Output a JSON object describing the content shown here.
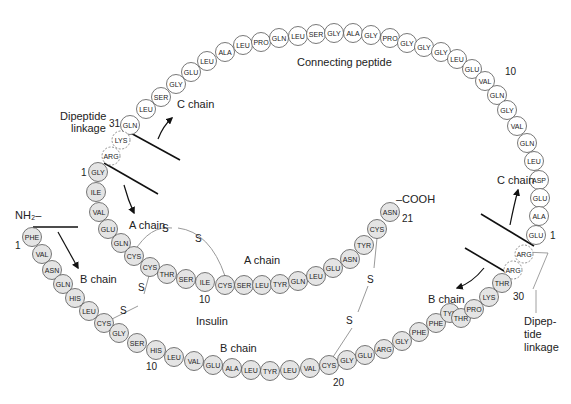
{
  "colors": {
    "filled_residue": "#e4e4e4",
    "open_residue": "#ffffff",
    "stroke": "#555555",
    "text": "#222222"
  },
  "labels": {
    "connecting_peptide": "Connecting peptide",
    "dipeptide_linkage_left_1": "Dipeptide",
    "dipeptide_linkage_left_2": "linkage",
    "dipeptide_linkage_right_1": "Dipep-",
    "dipeptide_linkage_right_2": "tide",
    "dipeptide_linkage_right_3": "linkage",
    "c_chain_top": "C chain",
    "c_chain_right": "C chain",
    "a_chain_arrow": "A chain",
    "a_chain_middle": "A chain",
    "b_chain_arrow_left": "B chain",
    "b_chain_arrow_right": "B chain",
    "b_chain_bottom": "B chain",
    "insulin": "Insulin",
    "nh2": "NH₂–",
    "cooh": "–COOH",
    "num_31": "31",
    "num_1_a": "1",
    "num_1_b": "1",
    "num_1_c": "1",
    "num_10_c": "10",
    "num_10_a": "10",
    "num_10_b": "10",
    "num_20_b": "20",
    "num_21_a": "21",
    "num_30_b": "30",
    "s1": "S",
    "s2": "S",
    "s3": "S",
    "s4": "S",
    "s5": "S",
    "s6": "S"
  },
  "c_peptide": [
    {
      "aa": "GLN",
      "x": 130,
      "y": 125
    },
    {
      "aa": "LEU",
      "x": 146,
      "y": 109
    },
    {
      "aa": "SER",
      "x": 161,
      "y": 97
    },
    {
      "aa": "GLY",
      "x": 176,
      "y": 84
    },
    {
      "aa": "GLU",
      "x": 191,
      "y": 72
    },
    {
      "aa": "LEU",
      "x": 207,
      "y": 61
    },
    {
      "aa": "ALA",
      "x": 225,
      "y": 52
    },
    {
      "aa": "LEU",
      "x": 243,
      "y": 45
    },
    {
      "aa": "PRO",
      "x": 261,
      "y": 42
    },
    {
      "aa": "GLN",
      "x": 279,
      "y": 38
    },
    {
      "aa": "LEU",
      "x": 298,
      "y": 36
    },
    {
      "aa": "SER",
      "x": 316,
      "y": 34
    },
    {
      "aa": "GLY",
      "x": 334,
      "y": 33
    },
    {
      "aa": "ALA",
      "x": 353,
      "y": 33
    },
    {
      "aa": "GLY",
      "x": 371,
      "y": 35
    },
    {
      "aa": "PRO",
      "x": 390,
      "y": 38
    },
    {
      "aa": "GLY",
      "x": 407,
      "y": 43
    },
    {
      "aa": "GLY",
      "x": 424,
      "y": 47
    },
    {
      "aa": "GLY",
      "x": 441,
      "y": 52
    },
    {
      "aa": "LEU",
      "x": 457,
      "y": 59
    },
    {
      "aa": "GLU",
      "x": 472,
      "y": 69
    },
    {
      "aa": "VAL",
      "x": 485,
      "y": 81
    },
    {
      "aa": "GLN",
      "x": 497,
      "y": 95
    },
    {
      "aa": "GLY",
      "x": 507,
      "y": 110
    },
    {
      "aa": "VAL",
      "x": 517,
      "y": 126
    },
    {
      "aa": "GLN",
      "x": 527,
      "y": 143
    },
    {
      "aa": "LEU",
      "x": 534,
      "y": 161
    },
    {
      "aa": "ASP",
      "x": 539,
      "y": 180
    },
    {
      "aa": "GLU",
      "x": 540,
      "y": 198
    },
    {
      "aa": "ALA",
      "x": 539,
      "y": 216
    },
    {
      "aa": "GLU",
      "x": 536,
      "y": 235
    }
  ],
  "dipeptide_left": [
    {
      "aa": "LYS",
      "x": 121,
      "y": 140
    },
    {
      "aa": "ARG",
      "x": 111,
      "y": 156
    }
  ],
  "dipeptide_right": [
    {
      "aa": "ARG",
      "x": 524,
      "y": 254
    },
    {
      "aa": "ARG",
      "x": 513,
      "y": 270
    }
  ],
  "a_chain": [
    {
      "aa": "GLY",
      "x": 98,
      "y": 172
    },
    {
      "aa": "ILE",
      "x": 96,
      "y": 192
    },
    {
      "aa": "VAL",
      "x": 99,
      "y": 212
    },
    {
      "aa": "GLU",
      "x": 108,
      "y": 229
    },
    {
      "aa": "GLN",
      "x": 121,
      "y": 243
    },
    {
      "aa": "CYS",
      "x": 134,
      "y": 256
    },
    {
      "aa": "CYS",
      "x": 150,
      "y": 267
    },
    {
      "aa": "THR",
      "x": 167,
      "y": 274
    },
    {
      "aa": "SER",
      "x": 186,
      "y": 279
    },
    {
      "aa": "ILE",
      "x": 205,
      "y": 282
    },
    {
      "aa": "CYS",
      "x": 225,
      "y": 285
    },
    {
      "aa": "SER",
      "x": 244,
      "y": 285
    },
    {
      "aa": "LEU",
      "x": 262,
      "y": 285
    },
    {
      "aa": "TYR",
      "x": 280,
      "y": 284
    },
    {
      "aa": "GLN",
      "x": 298,
      "y": 281
    },
    {
      "aa": "LEU",
      "x": 316,
      "y": 276
    },
    {
      "aa": "GLU",
      "x": 333,
      "y": 268
    },
    {
      "aa": "ASN",
      "x": 350,
      "y": 259
    },
    {
      "aa": "TYR",
      "x": 364,
      "y": 245
    },
    {
      "aa": "CYS",
      "x": 377,
      "y": 229
    },
    {
      "aa": "ASN",
      "x": 390,
      "y": 212
    }
  ],
  "b_chain": [
    {
      "aa": "PHE",
      "x": 32,
      "y": 237
    },
    {
      "aa": "VAL",
      "x": 42,
      "y": 254
    },
    {
      "aa": "ASN",
      "x": 52,
      "y": 270
    },
    {
      "aa": "GLN",
      "x": 63,
      "y": 284
    },
    {
      "aa": "HIS",
      "x": 75,
      "y": 298
    },
    {
      "aa": "LEU",
      "x": 89,
      "y": 311
    },
    {
      "aa": "CYS",
      "x": 104,
      "y": 323
    },
    {
      "aa": "GLY",
      "x": 119,
      "y": 333
    },
    {
      "aa": "SER",
      "x": 137,
      "y": 343
    },
    {
      "aa": "HIS",
      "x": 156,
      "y": 350
    },
    {
      "aa": "LEU",
      "x": 174,
      "y": 357
    },
    {
      "aa": "VAL",
      "x": 194,
      "y": 361
    },
    {
      "aa": "GLU",
      "x": 213,
      "y": 365
    },
    {
      "aa": "ALA",
      "x": 232,
      "y": 368
    },
    {
      "aa": "LEU",
      "x": 251,
      "y": 370
    },
    {
      "aa": "TYR",
      "x": 270,
      "y": 371
    },
    {
      "aa": "LEU",
      "x": 290,
      "y": 370
    },
    {
      "aa": "VAL",
      "x": 310,
      "y": 368
    },
    {
      "aa": "CYS",
      "x": 329,
      "y": 365
    },
    {
      "aa": "GLY",
      "x": 347,
      "y": 360
    },
    {
      "aa": "GLU",
      "x": 365,
      "y": 355
    },
    {
      "aa": "ARG",
      "x": 384,
      "y": 349
    },
    {
      "aa": "GLY",
      "x": 402,
      "y": 341
    },
    {
      "aa": "PHE",
      "x": 419,
      "y": 332
    },
    {
      "aa": "PHE",
      "x": 436,
      "y": 323
    },
    {
      "aa": "TYR",
      "x": 450,
      "y": 313
    },
    {
      "aa": "THR",
      "x": 461,
      "y": 318
    },
    {
      "aa": "PRO",
      "x": 474,
      "y": 309
    },
    {
      "aa": "LYS",
      "x": 489,
      "y": 297
    },
    {
      "aa": "THR",
      "x": 502,
      "y": 283
    }
  ]
}
